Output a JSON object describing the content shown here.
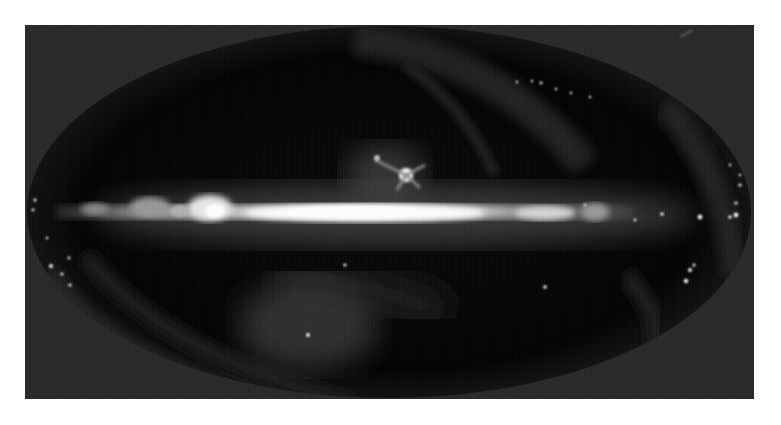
{
  "image": {
    "subject": "all-sky infrared map",
    "projection": "elliptical (Mollweide-like)",
    "colors": {
      "frame_background": "#2a2a2a",
      "sky_background": "#050505",
      "galactic_plane": "#f2f2f2",
      "page_background": "#ffffff"
    },
    "features": [
      {
        "name": "galactic-plane-band",
        "description": "bright horizontal band across center"
      },
      {
        "name": "galactic-center-bulge",
        "description": "brightest region near image center"
      },
      {
        "name": "rho-ophiuchi-cloud",
        "description": "bright knot above plane near center"
      },
      {
        "name": "orion-complex-left",
        "description": "bright clumps along plane on left"
      },
      {
        "name": "ecliptic-scan-arcs",
        "description": "faint curved arcs across upper and lower sky"
      },
      {
        "name": "magellanic-point-source",
        "description": "faint glow with point source lower center"
      },
      {
        "name": "scattered-point-sources",
        "description": "bright dots near left and right limbs"
      }
    ]
  }
}
